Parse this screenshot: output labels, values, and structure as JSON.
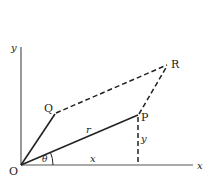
{
  "diagram": {
    "points": {
      "O": {
        "label": "O",
        "x": 21,
        "y": 165
      },
      "P": {
        "label": "P",
        "x": 138,
        "y": 115
      },
      "Q": {
        "label": "Q",
        "x": 55,
        "y": 112
      },
      "R": {
        "label": "R",
        "x": 168,
        "y": 64
      }
    },
    "axes": {
      "x_label": "x",
      "y_label": "y"
    },
    "annotations": {
      "r": "r",
      "x": "x",
      "y": "y",
      "theta": "θ"
    },
    "colors": {
      "line": "#222222",
      "axis": "#555555",
      "background": "#ffffff"
    }
  }
}
